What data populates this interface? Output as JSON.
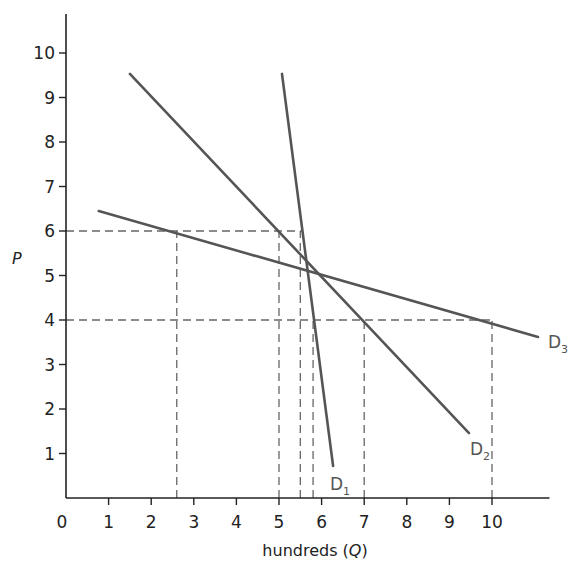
{
  "chart_data": {
    "type": "line",
    "title": "",
    "xlabel": "hundreds (Q)",
    "ylabel": "P",
    "xlim": [
      0,
      11
    ],
    "ylim": [
      0,
      10.8
    ],
    "x_ticks": [
      "0",
      "1",
      "2",
      "3",
      "4",
      "5",
      "6",
      "7",
      "8",
      "9",
      "10"
    ],
    "y_ticks": [
      "1",
      "2",
      "3",
      "4",
      "5",
      "6",
      "7",
      "8",
      "9",
      "10"
    ],
    "grid": false,
    "legend": "none (curve labels at line ends)",
    "series": [
      {
        "name": "D1",
        "label": "D",
        "subscript": "1",
        "points": [
          [
            5.07,
            9.53
          ],
          [
            6.27,
            0.72
          ]
        ]
      },
      {
        "name": "D2",
        "label": "D",
        "subscript": "2",
        "points": [
          [
            1.5,
            9.53
          ],
          [
            9.46,
            1.46
          ]
        ]
      },
      {
        "name": "D3",
        "label": "D",
        "subscript": "3",
        "points": [
          [
            0.77,
            6.45
          ],
          [
            11.08,
            3.62
          ]
        ]
      }
    ],
    "reference_lines": {
      "horizontal": [
        {
          "y": 6,
          "x_from": 0,
          "x_to": 5.55
        },
        {
          "y": 4,
          "x_from": 0,
          "x_to": 10
        }
      ],
      "vertical": [
        {
          "x": 2.6,
          "y_from": 0,
          "y_to": 6
        },
        {
          "x": 5.0,
          "y_from": 0,
          "y_to": 6
        },
        {
          "x": 5.5,
          "y_from": 0,
          "y_to": 6
        },
        {
          "x": 5.8,
          "y_from": 0,
          "y_to": 4
        },
        {
          "x": 7.0,
          "y_from": 0,
          "y_to": 4
        },
        {
          "x": 10.0,
          "y_from": 0,
          "y_to": 4
        }
      ]
    },
    "colors": {
      "axis": "#222222",
      "curve": "#555555",
      "dashed": "#666666"
    }
  }
}
